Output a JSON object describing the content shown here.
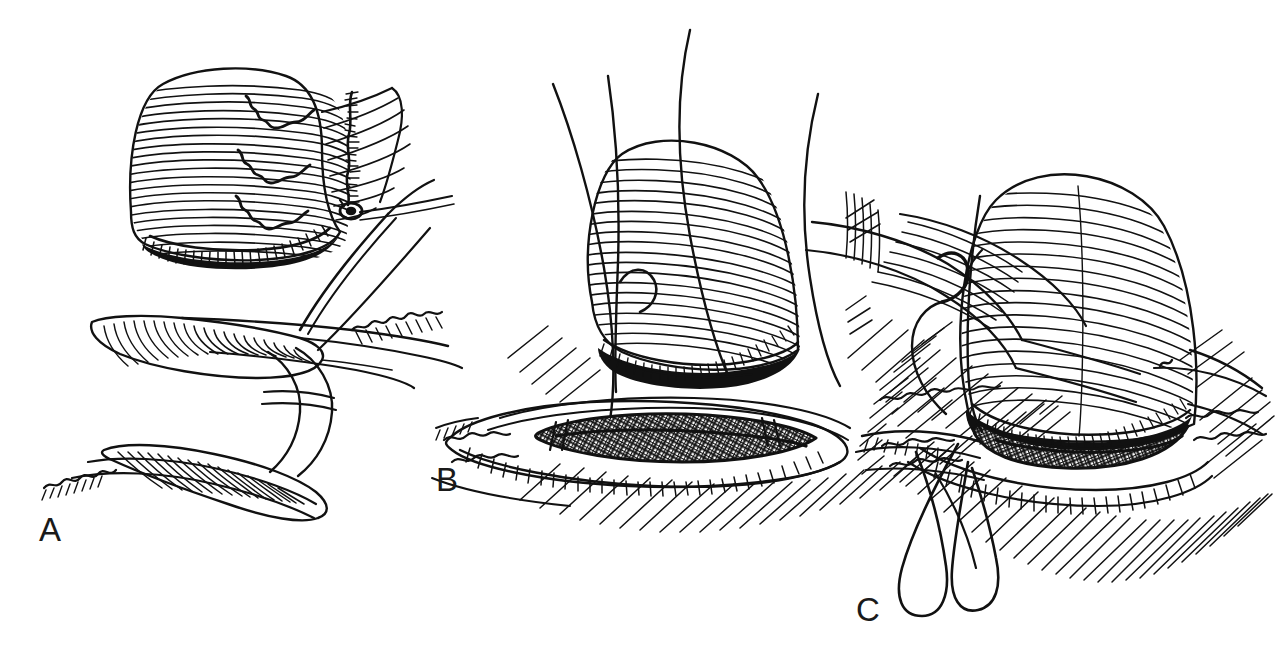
{
  "figure": {
    "type": "line-art-medical-illustration",
    "medium": "pen-and-ink stipple and hatch drawing",
    "background_color": "#ffffff",
    "ink_color": "#111111",
    "width": 1276,
    "height": 658,
    "caption_text": "",
    "panel_count": 3
  },
  "panels": [
    {
      "id": "A",
      "label": "A",
      "label_x": 39,
      "label_y": 513,
      "description": "Upper: mobilized tubular conduit (ureter/bowel segment) drawn with dense transverse hatching, three interrupted stay sutures placed along its posterior wall, the free end spatulated and one knotted suture with a small ring knot trailing to the right. Lower: sagittal/cut-away view of the everted seromuscular flaps and the submucosal tunnel, with a needle and suture passing through the incised edge.",
      "elements": [
        "hatched-conduit-segment",
        "spatulated-cut-end",
        "three-interrupted-sutures",
        "knotted-suture-with-ring-knot",
        "everted-tissue-flaps",
        "submucosal-tunnel",
        "needle-with-suture"
      ]
    },
    {
      "id": "B",
      "label": "B",
      "label_x": 436,
      "label_y": 463,
      "description": "Conduit end brought down to the seromuscular trough; four long suture tails sweep up out of the field. The longitudinal incision in the recipient viscus is held open, its dark cross-hatched mucosal bed exposed between everted hatched lips. Surrounding tissue rendered with parallel oblique hatching.",
      "elements": [
        "hatched-conduit-end",
        "four-suture-tails",
        "open-longitudinal-incision",
        "crosshatched-mucosal-bed",
        "everted-incision-lips",
        "oblique-field-hatching"
      ]
    },
    {
      "id": "C",
      "label": "C",
      "label_x": 856,
      "label_y": 593,
      "description": "Conduit seated vertically into the incision, its lumen aligned with the open cross-hatched bed. A curved surgical needle with attached suture enters at the left apex; two long suture loops hang free below the field. Dense radial hatching indicates the surrounding serosal surface.",
      "elements": [
        "seated-conduit",
        "curved-needle",
        "suture-loops",
        "crosshatched-anastomotic-bed",
        "everted-incision-lips",
        "radial-field-hatching"
      ]
    }
  ]
}
